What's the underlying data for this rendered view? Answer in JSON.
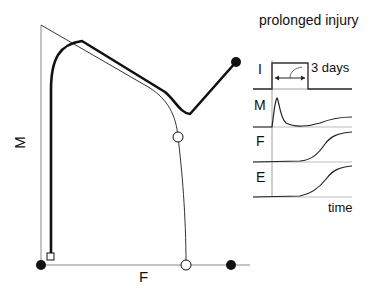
{
  "phase_plot": {
    "x_axis_label": "F",
    "y_axis_label": "M",
    "markers": {
      "start_square": "open-square",
      "origin_dot": "filled-circle",
      "fibrosis_dot": "filled-circle",
      "end_thick_dot": "filled-circle",
      "thin_curve_open_circle": "open-circle",
      "thin_curve_axis_open_circle": "open-circle"
    },
    "colors": {
      "line": "#111111",
      "axis": "#888888",
      "thin_line": "#333333"
    }
  },
  "timecourse_panel": {
    "title": "prolonged injury",
    "traces": [
      {
        "label": "I",
        "shape": "pulse"
      },
      {
        "label": "M",
        "shape": "spike-then-rise"
      },
      {
        "label": "F",
        "shape": "sigmoid-rise"
      },
      {
        "label": "E",
        "shape": "sigmoid-rise"
      }
    ],
    "duration_annotation": "3 days",
    "x_axis_label": "time"
  }
}
